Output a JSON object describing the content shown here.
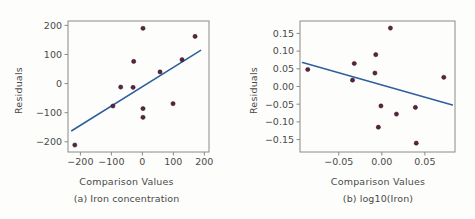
{
  "figure": {
    "background_color": "#ffffff",
    "axis_color": "#8a8a8a",
    "point_color": "#5c2340",
    "line_color": "#2e5f9e",
    "text_color": "#4a4a4a"
  },
  "chart_data": [
    {
      "type": "scatter",
      "panel_id": "a",
      "title": "",
      "caption": "(a) Iron concentration",
      "xlabel": "Comparison Values",
      "ylabel": "Residuals",
      "xlim": [
        -240,
        215
      ],
      "ylim": [
        -235,
        215
      ],
      "xticks": [
        -200,
        -100,
        0,
        100,
        200
      ],
      "xticklabels": [
        "−200",
        "−100",
        "0",
        "100",
        "200"
      ],
      "yticks": [
        200,
        100,
        0,
        -100,
        -200
      ],
      "yticklabels": [
        "200",
        "100",
        "0",
        "−100",
        "−200"
      ],
      "grid": false,
      "legend": "none",
      "points": [
        {
          "x": -218,
          "y": -211
        },
        {
          "x": -95,
          "y": -77
        },
        {
          "x": -70,
          "y": -12
        },
        {
          "x": -30,
          "y": -13
        },
        {
          "x": -28,
          "y": 76
        },
        {
          "x": 2,
          "y": 190
        },
        {
          "x": 2,
          "y": -86
        },
        {
          "x": 2,
          "y": -116
        },
        {
          "x": 57,
          "y": 40
        },
        {
          "x": 99,
          "y": -69
        },
        {
          "x": 128,
          "y": 82
        },
        {
          "x": 170,
          "y": 162
        }
      ],
      "fit_line": {
        "name": "reference line",
        "x": [
          -228,
          188
        ],
        "y": [
          -162,
          114
        ]
      }
    },
    {
      "type": "scatter",
      "panel_id": "b",
      "title": "",
      "caption": "(b) log10(Iron)",
      "xlabel": "Comparison Values",
      "ylabel": "Residuals",
      "xlim": [
        -0.095,
        0.085
      ],
      "ylim": [
        -0.185,
        0.185
      ],
      "xticks": [
        -0.05,
        0.0,
        0.05
      ],
      "xticklabels": [
        "−0.05",
        "0.00",
        "0.05"
      ],
      "yticks": [
        0.15,
        0.1,
        0.05,
        0.0,
        -0.05,
        -0.1,
        -0.15
      ],
      "yticklabels": [
        "0.15",
        "0.10",
        "0.05",
        "0.00",
        "−0.05",
        "−0.10",
        "−0.15"
      ],
      "grid": false,
      "legend": "none",
      "points": [
        {
          "x": -0.086,
          "y": 0.048
        },
        {
          "x": -0.032,
          "y": 0.065
        },
        {
          "x": -0.034,
          "y": 0.018
        },
        {
          "x": -0.007,
          "y": 0.09
        },
        {
          "x": -0.008,
          "y": 0.038
        },
        {
          "x": 0.01,
          "y": 0.165
        },
        {
          "x": -0.001,
          "y": -0.055
        },
        {
          "x": -0.004,
          "y": -0.115
        },
        {
          "x": 0.017,
          "y": -0.078
        },
        {
          "x": 0.039,
          "y": -0.059
        },
        {
          "x": 0.04,
          "y": -0.16
        },
        {
          "x": 0.072,
          "y": 0.026
        }
      ],
      "fit_line": {
        "name": "reference line",
        "x": [
          -0.092,
          0.082
        ],
        "y": [
          0.068,
          -0.052
        ]
      }
    }
  ]
}
